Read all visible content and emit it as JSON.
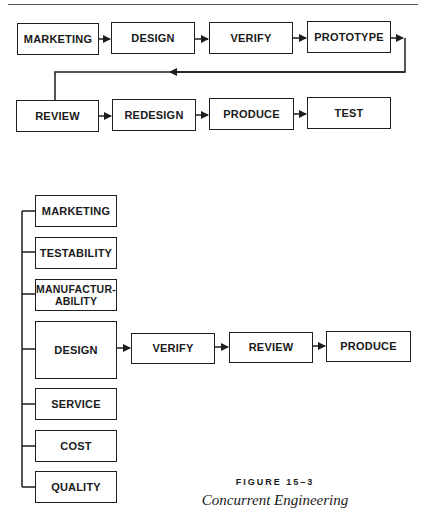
{
  "sequential": {
    "row1": [
      {
        "label": "MARKETING"
      },
      {
        "label": "DESIGN"
      },
      {
        "label": "VERIFY"
      },
      {
        "label": "PROTOTYPE"
      }
    ],
    "row2": [
      {
        "label": "REVIEW"
      },
      {
        "label": "REDESIGN"
      },
      {
        "label": "PRODUCE"
      },
      {
        "label": "TEST"
      }
    ]
  },
  "concurrent": {
    "inputs": [
      {
        "label": "MARKETING"
      },
      {
        "label": "TESTABILITY"
      },
      {
        "label": "MANUFACTUR-\nABILITY"
      },
      {
        "label": "DESIGN"
      },
      {
        "label": "SERVICE"
      },
      {
        "label": "COST"
      },
      {
        "label": "QUALITY"
      }
    ],
    "chain": [
      {
        "label": "VERIFY"
      },
      {
        "label": "REVIEW"
      },
      {
        "label": "PRODUCE"
      }
    ]
  },
  "caption": {
    "figure_number": "FIGURE 15–3",
    "title": "Concurrent Engineering"
  },
  "colors": {
    "line": "#1e1e1e",
    "text": "#1a1a1a",
    "background": "#ffffff"
  }
}
